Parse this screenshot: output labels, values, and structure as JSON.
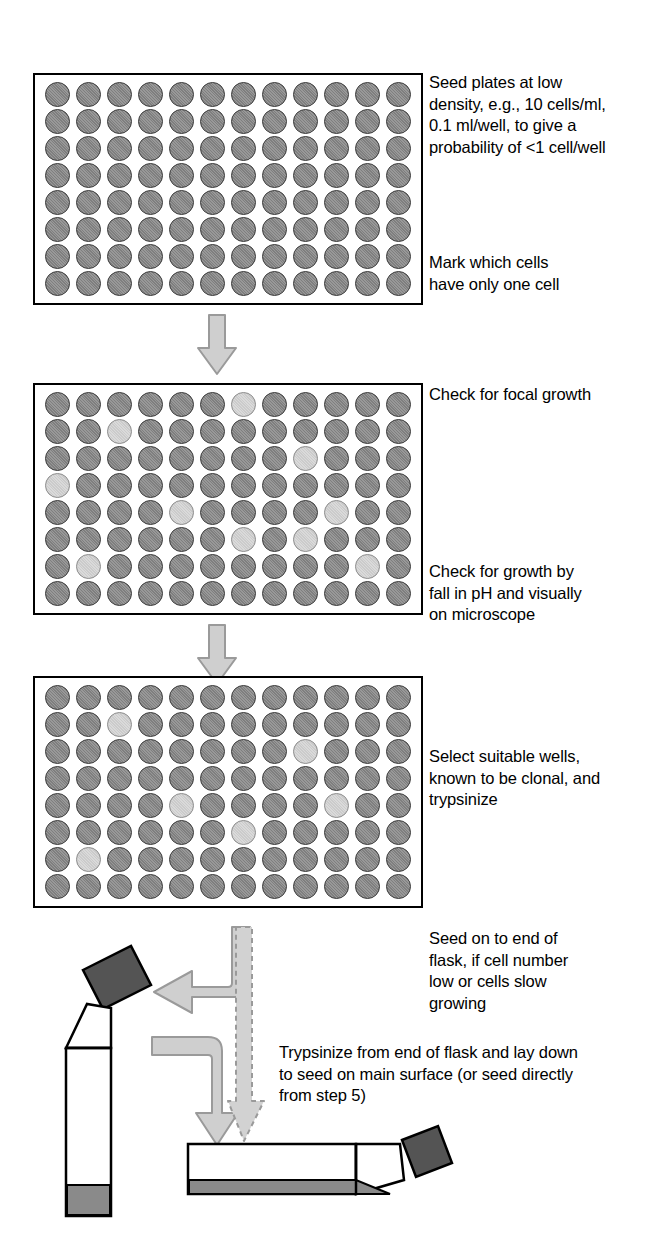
{
  "diagram": {
    "plate": {
      "rows": 8,
      "columns": 12,
      "well_states": {
        "dark": "no focal growth",
        "light": "focal growth"
      }
    },
    "plates": [
      {
        "id": "plate-1",
        "light_wells": []
      },
      {
        "id": "plate-2",
        "light_wells": [
          [
            0,
            6
          ],
          [
            1,
            2
          ],
          [
            2,
            8
          ],
          [
            3,
            0
          ],
          [
            4,
            4
          ],
          [
            4,
            9
          ],
          [
            5,
            6
          ],
          [
            5,
            8
          ],
          [
            6,
            1
          ],
          [
            6,
            10
          ]
        ]
      },
      {
        "id": "plate-3",
        "light_wells": [
          [
            1,
            2
          ],
          [
            2,
            8
          ],
          [
            4,
            4
          ],
          [
            4,
            9
          ],
          [
            5,
            6
          ],
          [
            6,
            1
          ]
        ]
      }
    ],
    "notes": {
      "seed_plates": "Seed plates at low\ndensity, e.g., 10 cells/ml,\n0.1 ml/well, to give a\nprobability of <1 cell/well",
      "mark_cells": "Mark which cells\nhave only one cell",
      "check_focal_growth": "Check for focal growth",
      "check_growth_ph": "Check for growth by\nfall in pH and visually\non microscope",
      "select_wells": "Select suitable wells,\nknown to be clonal, and\ntrypsinize",
      "seed_end_of_flask": "Seed on to end of\nflask, if cell number\nlow or cells slow\ngrowing",
      "trypsinize_lay_down": "Trypsinize from end of flask and lay down\nto seed on main surface (or seed directly\nfrom step 5)"
    },
    "flasks": [
      {
        "id": "flask-upright",
        "orientation": "upright",
        "description": "flask standing on end with medium pooled at the base"
      },
      {
        "id": "flask-horizontal",
        "orientation": "horizontal",
        "description": "flask laid down with medium across the main growth surface"
      }
    ],
    "arrows": [
      {
        "id": "arrow-plate1-to-plate2",
        "style": "solid",
        "direction": "down"
      },
      {
        "id": "arrow-plate2-to-plate3",
        "style": "solid",
        "direction": "down"
      },
      {
        "id": "arrow-to-upright-flask",
        "style": "solid",
        "direction": "left"
      },
      {
        "id": "arrow-to-horizontal-flask",
        "style": "solid",
        "direction": "down"
      },
      {
        "id": "arrow-direct-seed",
        "style": "dashed",
        "direction": "down"
      }
    ],
    "colors": {
      "well_dark": "#7f7f7f",
      "well_light": "#dadada",
      "arrow_fill": "#cfcfcf",
      "arrow_stroke": "#9a9a9a",
      "flask_cap": "#545454",
      "flask_medium": "#8a8a8a",
      "plate_border": "#000000"
    }
  }
}
